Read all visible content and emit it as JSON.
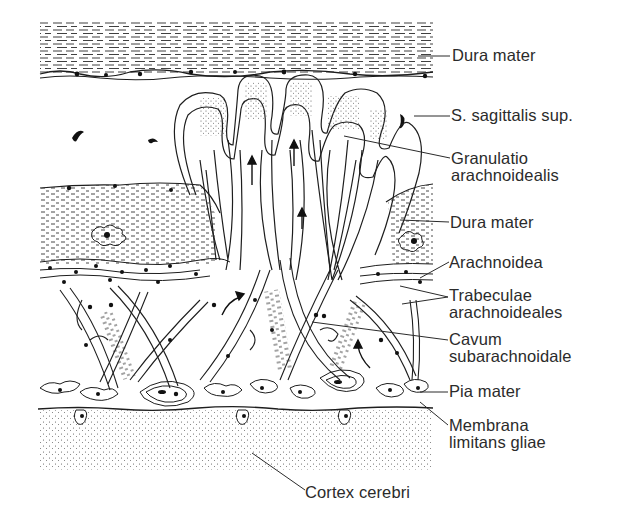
{
  "figure": {
    "labels": [
      {
        "id": "dura-mater-top",
        "lines": [
          "Dura mater"
        ],
        "x": 452,
        "y": 47
      },
      {
        "id": "sinus-sagittalis",
        "lines": [
          "S. sagittalis sup."
        ],
        "x": 451,
        "y": 107
      },
      {
        "id": "granulatio",
        "lines": [
          "Granulatio",
          "arachnoidealis"
        ],
        "x": 451,
        "y": 150
      },
      {
        "id": "dura-mater-mid",
        "lines": [
          "Dura mater"
        ],
        "x": 450,
        "y": 214
      },
      {
        "id": "arachnoidea",
        "lines": [
          "Arachnoidea"
        ],
        "x": 449,
        "y": 255
      },
      {
        "id": "trabeculae",
        "lines": [
          "Trabeculae",
          "arachnoideales"
        ],
        "x": 449,
        "y": 286
      },
      {
        "id": "cavum",
        "lines": [
          "Cavum",
          "subarachnoidale"
        ],
        "x": 449,
        "y": 331
      },
      {
        "id": "pia-mater",
        "lines": [
          "Pia mater"
        ],
        "x": 449,
        "y": 383
      },
      {
        "id": "membrana",
        "lines": [
          "Membrana",
          "limitans gliae"
        ],
        "x": 449,
        "y": 417
      },
      {
        "id": "cortex",
        "lines": [
          "Cortex cerebri"
        ],
        "x": 305,
        "y": 487
      }
    ],
    "colors": {
      "ink": "#1e1e1e",
      "paper": "#ffffff",
      "stipple": "#6f6f6f",
      "label": "#2b2b2b"
    }
  }
}
